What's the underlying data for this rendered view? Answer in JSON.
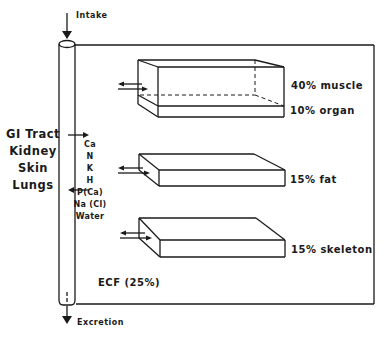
{
  "diagram": {
    "flow": {
      "intake_label": "Intake",
      "excretion_label": "Excretion"
    },
    "exchange_organs": [
      "GI Tract",
      "Kidney",
      "Skin",
      "Lungs"
    ],
    "exchanged_substances": [
      "Ca",
      "N",
      "K",
      "H",
      "P(Ca)",
      "Na (Cl)",
      "Water"
    ],
    "compartments": [
      {
        "label": "40% muscle",
        "percent": 40,
        "tissue": "muscle"
      },
      {
        "label": "10% organ",
        "percent": 10,
        "tissue": "organ"
      },
      {
        "label": "15% fat",
        "percent": 15,
        "tissue": "fat"
      },
      {
        "label": "15% skeleton",
        "percent": 15,
        "tissue": "skeleton"
      }
    ],
    "ecf_label": "ECF (25%)",
    "line_color": "#1a1a1a"
  }
}
